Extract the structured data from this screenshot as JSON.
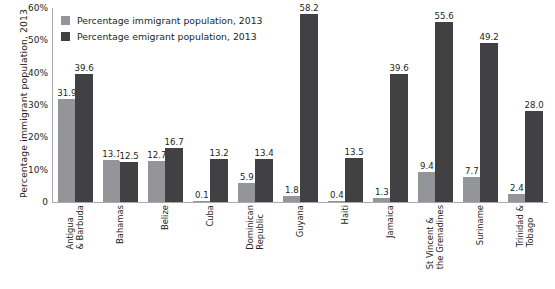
{
  "chart_data": {
    "type": "bar",
    "title": "",
    "xlabel": "",
    "ylabel": "Percentage immigrant population, 2013",
    "ylim": [
      0,
      60
    ],
    "ytick_labels": [
      "0",
      "10%",
      "20%",
      "30%",
      "40%",
      "50%",
      "60%"
    ],
    "ytick_values": [
      0,
      10,
      20,
      30,
      40,
      50,
      60
    ],
    "grid": false,
    "legend_position": "top-left",
    "categories": [
      "Antigua\n& Barbuda",
      "Bahamas",
      "Belize",
      "Cuba",
      "Dominican\nRepublic",
      "Guyana",
      "Haiti",
      "Jamaica",
      "St Vincent &\nthe Grenadines",
      "Suriname",
      "Trinidad &\nTobago"
    ],
    "series": [
      {
        "name": "Percentage immigrant population, 2013",
        "color": "#939598",
        "values": [
          31.9,
          13.1,
          12.7,
          0.1,
          5.9,
          1.8,
          0.4,
          1.3,
          9.4,
          7.7,
          2.4
        ]
      },
      {
        "name": "Percentage emigrant population, 2013",
        "color": "#414042",
        "values": [
          39.6,
          12.5,
          16.7,
          13.2,
          13.4,
          58.2,
          13.5,
          39.6,
          55.6,
          49.2,
          28.0
        ]
      }
    ],
    "data_labels": [
      [
        "31.9",
        "39.6"
      ],
      [
        "13.1",
        "12.5"
      ],
      [
        "12.7",
        "16.7"
      ],
      [
        "0.1",
        "13.2"
      ],
      [
        "5.9",
        "13.4"
      ],
      [
        "1.8",
        "58.2"
      ],
      [
        "0.4",
        "13.5"
      ],
      [
        "1.3",
        "39.6"
      ],
      [
        "9.4",
        "55.6"
      ],
      [
        "7.7",
        "49.2"
      ],
      [
        "2.4",
        "28.0"
      ]
    ]
  },
  "legend": {
    "items": [
      {
        "label": "Percentage immigrant population, 2013",
        "swatch": "imm"
      },
      {
        "label": "Percentage emigrant population, 2013",
        "swatch": "emi"
      }
    ]
  },
  "footer": {
    "mark": ""
  }
}
